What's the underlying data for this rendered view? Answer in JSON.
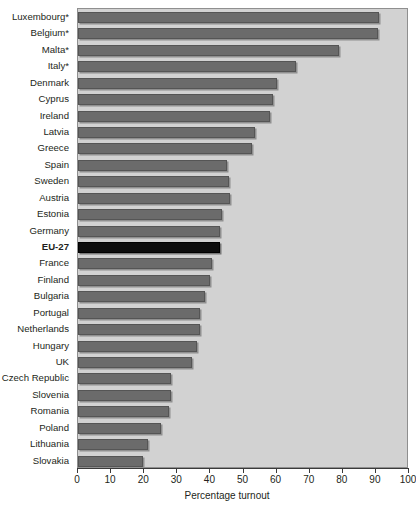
{
  "chart_data": {
    "type": "bar",
    "orientation": "horizontal",
    "title": "",
    "xlabel": "Percentage turnout",
    "ylabel": "",
    "xlim": [
      0,
      100
    ],
    "xticks": [
      0,
      10,
      20,
      30,
      40,
      50,
      60,
      70,
      80,
      90,
      100
    ],
    "grid": false,
    "legend": null,
    "highlight_category": "EU-27",
    "colors": {
      "bar": "#6b6b6b",
      "highlight_bar": "#0d0d0d",
      "plot_background": "#d2d2d2",
      "page_background": "#ffffff",
      "text": "#231f20",
      "axis": "#3a3a3a"
    },
    "categories": [
      "Luxembourg*",
      "Belgium*",
      "Malta*",
      "Italy*",
      "Denmark",
      "Cyprus",
      "Ireland",
      "Latvia",
      "Greece",
      "Spain",
      "Sweden",
      "Austria",
      "Estonia",
      "Germany",
      "EU-27",
      "France",
      "Finland",
      "Bulgaria",
      "Portugal",
      "Netherlands",
      "Hungary",
      "UK",
      "Czech Republic",
      "Slovenia",
      "Romania",
      "Poland",
      "Lithuania",
      "Slovakia"
    ],
    "values": [
      91.0,
      90.5,
      79.0,
      66.0,
      60.0,
      59.0,
      58.0,
      53.5,
      52.5,
      45.0,
      45.5,
      46.0,
      43.5,
      43.0,
      43.0,
      40.5,
      40.0,
      38.5,
      37.0,
      36.8,
      36.0,
      34.5,
      28.0,
      28.0,
      27.5,
      25.0,
      21.0,
      19.6
    ]
  }
}
